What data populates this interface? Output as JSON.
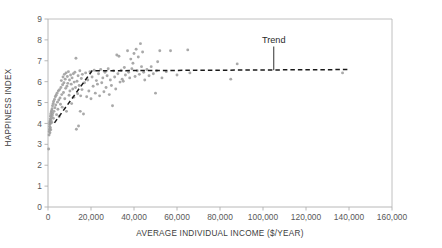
{
  "chart_data": {
    "type": "scatter",
    "title": "",
    "xlabel": "AVERAGE INDIVIDUAL INCOME ($/YEAR)",
    "ylabel": "HAPPINESS INDEX",
    "xlim": [
      0,
      160000
    ],
    "ylim": [
      0,
      9
    ],
    "grid": false,
    "legend": null,
    "xticks": [
      0,
      20000,
      40000,
      60000,
      80000,
      100000,
      120000,
      140000,
      160000
    ],
    "xtick_labels": [
      "0",
      "20,000",
      "40,000",
      "60,000",
      "80,000",
      "100,000",
      "120,000",
      "140,000",
      "160,000"
    ],
    "yticks": [
      0,
      1,
      2,
      3,
      4,
      5,
      6,
      7,
      8,
      9
    ],
    "ytick_labels": [
      "0",
      "1",
      "2",
      "3",
      "4",
      "5",
      "6",
      "7",
      "8",
      "9"
    ],
    "point_color": "#9a9a9a",
    "trend_color": "#1a1a1a",
    "axis_color": "#b0b0b0",
    "annotations": [
      {
        "text": "Trend",
        "x": 105000,
        "y": 7.85,
        "leader_to_x": 105000,
        "leader_to_y": 6.55
      }
    ],
    "series": [
      {
        "name": "countries",
        "marker": "circle",
        "points": [
          [
            300,
            2.78
          ],
          [
            500,
            3.45
          ],
          [
            600,
            3.62
          ],
          [
            700,
            3.72
          ],
          [
            750,
            3.85
          ],
          [
            800,
            3.95
          ],
          [
            850,
            4.05
          ],
          [
            900,
            3.55
          ],
          [
            950,
            4.12
          ],
          [
            1000,
            3.98
          ],
          [
            1050,
            4.22
          ],
          [
            1100,
            3.8
          ],
          [
            1150,
            4.35
          ],
          [
            1200,
            4.02
          ],
          [
            1250,
            4.45
          ],
          [
            1300,
            3.7
          ],
          [
            1400,
            4.15
          ],
          [
            1500,
            4.55
          ],
          [
            1600,
            4.28
          ],
          [
            1700,
            4.62
          ],
          [
            1800,
            4.05
          ],
          [
            1900,
            4.7
          ],
          [
            2000,
            4.38
          ],
          [
            2100,
            4.85
          ],
          [
            2200,
            4.48
          ],
          [
            2400,
            4.95
          ],
          [
            2500,
            4.25
          ],
          [
            2600,
            5.05
          ],
          [
            2800,
            4.58
          ],
          [
            3000,
            5.15
          ],
          [
            3200,
            4.75
          ],
          [
            3400,
            5.28
          ],
          [
            3600,
            4.88
          ],
          [
            3800,
            5.35
          ],
          [
            4000,
            4.42
          ],
          [
            4200,
            5.45
          ],
          [
            4400,
            5.02
          ],
          [
            4600,
            4.68
          ],
          [
            4800,
            5.55
          ],
          [
            5000,
            5.12
          ],
          [
            5200,
            4.32
          ],
          [
            5400,
            5.62
          ],
          [
            5600,
            5.22
          ],
          [
            5800,
            4.92
          ],
          [
            6000,
            5.72
          ],
          [
            6200,
            6.05
          ],
          [
            6400,
            5.38
          ],
          [
            6600,
            4.78
          ],
          [
            6800,
            5.85
          ],
          [
            7000,
            6.22
          ],
          [
            7200,
            5.48
          ],
          [
            7400,
            5.95
          ],
          [
            7600,
            6.35
          ],
          [
            7800,
            5.18
          ],
          [
            8000,
            6.12
          ],
          [
            8200,
            5.68
          ],
          [
            8400,
            6.42
          ],
          [
            8600,
            4.58
          ],
          [
            8800,
            5.78
          ],
          [
            9000,
            6.25
          ],
          [
            9200,
            5.92
          ],
          [
            9500,
            6.48
          ],
          [
            9800,
            5.35
          ],
          [
            10000,
            6.08
          ],
          [
            10200,
            5.55
          ],
          [
            10500,
            6.32
          ],
          [
            10800,
            5.88
          ],
          [
            11000,
            4.95
          ],
          [
            11200,
            6.18
          ],
          [
            11500,
            5.65
          ],
          [
            11800,
            6.38
          ],
          [
            12000,
            5.25
          ],
          [
            12200,
            5.98
          ],
          [
            12500,
            6.45
          ],
          [
            12800,
            5.72
          ],
          [
            13000,
            7.12
          ],
          [
            13200,
            3.72
          ],
          [
            13500,
            6.02
          ],
          [
            13800,
            5.42
          ],
          [
            14000,
            6.28
          ],
          [
            14200,
            3.88
          ],
          [
            14500,
            5.82
          ],
          [
            14800,
            6.52
          ],
          [
            15000,
            4.58
          ],
          [
            15200,
            5.32
          ],
          [
            15500,
            6.15
          ],
          [
            15800,
            5.62
          ],
          [
            16000,
            6.35
          ],
          [
            16500,
            4.45
          ],
          [
            17000,
            5.95
          ],
          [
            17500,
            6.42
          ],
          [
            18000,
            5.28
          ],
          [
            18500,
            6.08
          ],
          [
            19000,
            5.55
          ],
          [
            19500,
            6.48
          ],
          [
            20000,
            5.18
          ],
          [
            20500,
            6.22
          ],
          [
            21000,
            5.78
          ],
          [
            21500,
            6.55
          ],
          [
            22000,
            5.45
          ],
          [
            22500,
            6.05
          ],
          [
            23000,
            5.88
          ],
          [
            23500,
            6.38
          ],
          [
            24000,
            5.32
          ],
          [
            24500,
            6.58
          ],
          [
            25000,
            5.95
          ],
          [
            25500,
            6.18
          ],
          [
            26000,
            5.52
          ],
          [
            26500,
            6.45
          ],
          [
            27000,
            5.72
          ],
          [
            27500,
            6.28
          ],
          [
            28000,
            6.62
          ],
          [
            28500,
            5.38
          ],
          [
            29000,
            6.08
          ],
          [
            29500,
            5.82
          ],
          [
            30000,
            4.85
          ],
          [
            30500,
            6.52
          ],
          [
            31000,
            6.22
          ],
          [
            31500,
            5.65
          ],
          [
            32000,
            7.28
          ],
          [
            32500,
            6.38
          ],
          [
            33000,
            7.22
          ],
          [
            33500,
            5.98
          ],
          [
            34000,
            6.55
          ],
          [
            34500,
            6.12
          ],
          [
            35000,
            6.02
          ],
          [
            35500,
            6.68
          ],
          [
            36000,
            6.32
          ],
          [
            37000,
            7.48
          ],
          [
            37500,
            6.45
          ],
          [
            38000,
            6.18
          ],
          [
            38500,
            7.08
          ],
          [
            39000,
            6.62
          ],
          [
            39500,
            6.88
          ],
          [
            40000,
            7.35
          ],
          [
            40500,
            6.25
          ],
          [
            41000,
            7.55
          ],
          [
            41500,
            6.52
          ],
          [
            42000,
            7.18
          ],
          [
            42500,
            6.35
          ],
          [
            43000,
            7.82
          ],
          [
            43500,
            6.72
          ],
          [
            44000,
            7.42
          ],
          [
            44500,
            6.45
          ],
          [
            45000,
            6.08
          ],
          [
            46000,
            6.58
          ],
          [
            47000,
            6.28
          ],
          [
            48000,
            6.72
          ],
          [
            49000,
            6.38
          ],
          [
            50000,
            5.45
          ],
          [
            50500,
            6.52
          ],
          [
            51000,
            6.95
          ],
          [
            52000,
            7.48
          ],
          [
            53000,
            6.18
          ],
          [
            55000,
            6.48
          ],
          [
            57000,
            7.48
          ],
          [
            60000,
            6.32
          ],
          [
            65000,
            7.52
          ],
          [
            66000,
            6.42
          ],
          [
            85000,
            6.12
          ],
          [
            88000,
            6.85
          ],
          [
            137000,
            6.42
          ]
        ]
      }
    ],
    "trend": {
      "name": "Trend",
      "style": "dashed",
      "vertices": [
        [
          3000,
          4.03
        ],
        [
          20500,
          6.52
        ],
        [
          140000,
          6.58
        ]
      ]
    }
  }
}
